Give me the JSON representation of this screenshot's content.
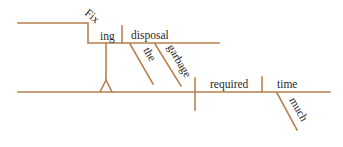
{
  "diagram": {
    "type": "sentence-diagram",
    "line_color": "#b8804f",
    "text_color": "#2a2a2a",
    "gerund_phrase": {
      "gerund_part1": "Fix",
      "gerund_part2": "ing",
      "object": "disposal",
      "modifiers": [
        "the",
        "garbage"
      ]
    },
    "main_clause": {
      "verb": "required",
      "object": "time",
      "object_modifier": "much"
    }
  }
}
